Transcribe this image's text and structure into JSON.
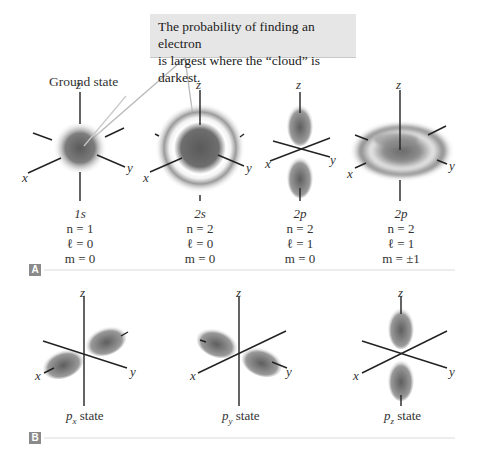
{
  "callout": {
    "line1": "The probability of finding an electron",
    "line2": "is largest where the “cloud” is darkest."
  },
  "panel_a": {
    "label": "A",
    "heading": "Ground state",
    "orbitals": [
      {
        "name": "1s",
        "n": "n = 1",
        "l": "ℓ = 0",
        "m": "m = 0"
      },
      {
        "name": "2s",
        "n": "n = 2",
        "l": "ℓ = 0",
        "m": "m = 0"
      },
      {
        "name": "2p",
        "n": "n = 2",
        "l": "ℓ = 1",
        "m": "m = 0"
      },
      {
        "name": "2p",
        "n": "n = 2",
        "l": "ℓ = 1",
        "m": "m = ±1"
      }
    ]
  },
  "panel_b": {
    "label": "B",
    "states": [
      {
        "name": "p",
        "sub": "x",
        "suffix": " state"
      },
      {
        "name": "p",
        "sub": "y",
        "suffix": " state"
      },
      {
        "name": "p",
        "sub": "z",
        "suffix": " state"
      }
    ]
  },
  "axes": {
    "x": "x",
    "y": "y",
    "z": "z"
  },
  "colors": {
    "cloud": "#5a5a5a",
    "axis": "#222222",
    "callout_bg": "#e6e6e6",
    "pointer": "#b8b8b8",
    "label_bg": "#8a8a8a",
    "rule": "#d8d8d8"
  }
}
